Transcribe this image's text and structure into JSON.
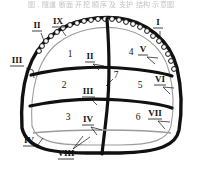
{
  "figure": {
    "title_strip": "图 ,  隧道  断面  开挖  顺序  及  支护  结构  示意图",
    "type": "tunnel-cross-section",
    "colors": {
      "outline": "#111111",
      "inner_line": "#9b9b9b",
      "background": "#ffffff"
    }
  },
  "zones": [
    {
      "id": "zone-1",
      "label": "1",
      "x": 70,
      "y": 57
    },
    {
      "id": "zone-2",
      "label": "2",
      "x": 64,
      "y": 88
    },
    {
      "id": "zone-3",
      "label": "3",
      "x": 68,
      "y": 120
    },
    {
      "id": "zone-4",
      "label": "4",
      "x": 131,
      "y": 55
    },
    {
      "id": "zone-5",
      "label": "5",
      "x": 140,
      "y": 88
    },
    {
      "id": "zone-6",
      "label": "6",
      "x": 138,
      "y": 120
    },
    {
      "id": "zone-7",
      "label": "7",
      "x": 114,
      "y": 76
    }
  ],
  "callouts": [
    {
      "id": "callout-I",
      "label": "I",
      "x": 158,
      "y": 24,
      "underline": true
    },
    {
      "id": "callout-II",
      "label": "II",
      "x": 37,
      "y": 26,
      "underline": true
    },
    {
      "id": "callout-III",
      "label": "III",
      "x": 16,
      "y": 62,
      "underline": true
    },
    {
      "id": "callout-IV",
      "label": "IV",
      "x": 29,
      "y": 143,
      "underline": true
    },
    {
      "id": "callout-V",
      "label": "V",
      "x": 143,
      "y": 50,
      "underline": true
    },
    {
      "id": "callout-VI",
      "label": "VI",
      "x": 160,
      "y": 80,
      "underline": true
    },
    {
      "id": "callout-VII",
      "label": "VII",
      "x": 155,
      "y": 114,
      "underline": true
    },
    {
      "id": "callout-VIII",
      "label": "VIII",
      "x": 66,
      "y": 155,
      "underline": true
    },
    {
      "id": "callout-IX",
      "label": "IX",
      "x": 58,
      "y": 22,
      "underline": true
    },
    {
      "id": "callout-inner-II",
      "label": "II",
      "x": 90,
      "y": 57,
      "underline": true
    },
    {
      "id": "callout-inner-III",
      "label": "III",
      "x": 88,
      "y": 92,
      "underline": true
    },
    {
      "id": "callout-inner-IV",
      "label": "IV",
      "x": 88,
      "y": 120,
      "underline": true
    }
  ],
  "bolts": {
    "name": "rock-bolt-anchor",
    "count": 24,
    "description": "small circles along tunnel crown"
  }
}
